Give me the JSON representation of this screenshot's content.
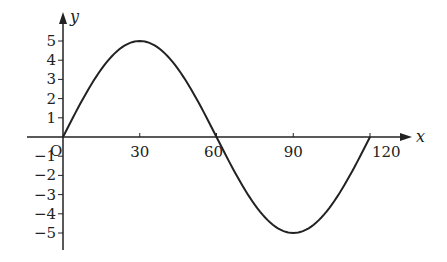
{
  "chart_data": {
    "type": "line",
    "title": "",
    "xlabel": "x",
    "ylabel": "y",
    "origin_label": "O",
    "x_ticks": [
      30,
      60,
      90,
      120
    ],
    "x_tick_labels": [
      "30",
      "60",
      "90",
      "120"
    ],
    "y_ticks": [
      -5,
      -4,
      -3,
      -2,
      -1,
      1,
      2,
      3,
      4,
      5
    ],
    "y_tick_labels": [
      "−5",
      "−4",
      "−3",
      "−2",
      "−1",
      "1",
      "2",
      "3",
      "4",
      "5"
    ],
    "xlim": [
      0,
      120
    ],
    "ylim": [
      -5,
      5
    ],
    "grid": false,
    "series": [
      {
        "name": "y = 5 sin(3x)",
        "x": [
          0,
          10,
          20,
          30,
          40,
          50,
          60,
          70,
          80,
          90,
          100,
          110,
          120
        ],
        "values": [
          0,
          2.5,
          4.33,
          5,
          4.33,
          2.5,
          0,
          -2.5,
          -4.33,
          -5,
          -4.33,
          -2.5,
          0
        ]
      }
    ],
    "line_color": "#222222"
  }
}
